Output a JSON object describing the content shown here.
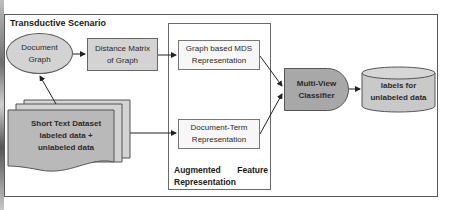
{
  "diagram": {
    "title": "Transductive Scenario",
    "nodes": {
      "document_graph": {
        "label": "Document\nGraph",
        "shape": "ellipse"
      },
      "distance_matrix": {
        "label": "Distance Matrix\nof Graph",
        "shape": "rectangle"
      },
      "graph_mds": {
        "label": "Graph based MDS\nRepresentation",
        "shape": "rectangle"
      },
      "document_term": {
        "label": "Document-Term\nRepresentation",
        "shape": "rectangle"
      },
      "classifier": {
        "label": "Multi-View\nClassifier",
        "shape": "delay"
      },
      "labels_output": {
        "label": "labels for\nunlabeled data",
        "shape": "cylinder"
      },
      "dataset": {
        "label": "Short Text Dataset\nlabeled data +\nunlabeled data",
        "shape": "multi-document"
      }
    },
    "group": {
      "label_word1": "Augmented",
      "label_word2": "Feature",
      "label_line2": "Representation"
    },
    "edges": [
      {
        "from": "dataset",
        "to": "document_graph"
      },
      {
        "from": "document_graph",
        "to": "distance_matrix"
      },
      {
        "from": "distance_matrix",
        "to": "graph_mds"
      },
      {
        "from": "dataset",
        "to": "document_term"
      },
      {
        "from": "graph_mds",
        "to": "classifier"
      },
      {
        "from": "document_term",
        "to": "classifier"
      },
      {
        "from": "classifier",
        "to": "labels_output"
      }
    ],
    "colors": {
      "light_fill": "#d3d3d3",
      "dark_fill": "#a8a8a8",
      "border": "#555555"
    }
  }
}
